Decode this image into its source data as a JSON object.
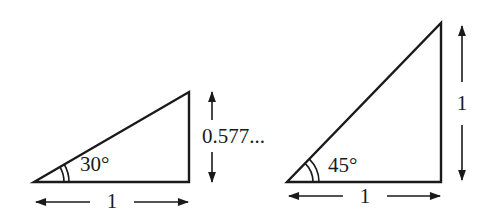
{
  "diagram": {
    "triangles": [
      {
        "angle_label": "30°",
        "base_label": "1",
        "height_label": "0.577..."
      },
      {
        "angle_label": "45°",
        "base_label": "1",
        "height_label": "1"
      }
    ],
    "line_color": "#1a1a1a"
  }
}
